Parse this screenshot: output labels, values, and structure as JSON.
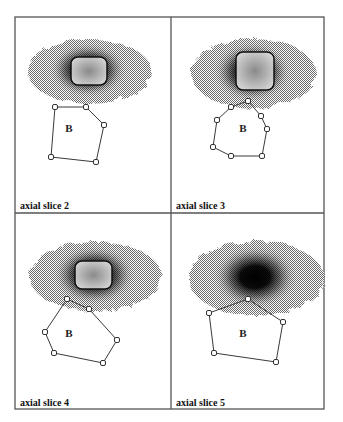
{
  "figure": {
    "grid": {
      "left": 15,
      "top": 17,
      "mid_x": 171,
      "mid_y": 213,
      "right": 324,
      "bottom": 409
    },
    "colors": {
      "frame": "#555555",
      "polygon": "#3a3a3a",
      "blob_dark": "#111111",
      "blob_halo": "#9a9a9a",
      "core": "#c8c8c8"
    },
    "panels": [
      {
        "id": "slice2",
        "label": "axial slice 2",
        "region_label": "B",
        "region_label_pos": [
          69,
          132
        ],
        "label_pos": [
          20,
          209
        ],
        "blob": {
          "cx": 88,
          "cy": 70,
          "rx": 62,
          "ry": 32,
          "core": {
            "x": 71,
            "y": 57,
            "w": 36,
            "h": 28
          },
          "has_core": true
        },
        "polygon": [
          [
            55,
            107
          ],
          [
            86,
            107
          ],
          [
            104,
            125
          ],
          [
            96,
            162
          ],
          [
            51,
            157
          ]
        ]
      },
      {
        "id": "slice3",
        "label": "axial slice 3",
        "region_label": "B",
        "region_label_pos": [
          243,
          132
        ],
        "label_pos": [
          176,
          209
        ],
        "blob": {
          "cx": 252,
          "cy": 72,
          "rx": 62,
          "ry": 35,
          "core": {
            "x": 236,
            "y": 52,
            "w": 38,
            "h": 38
          },
          "has_core": true
        },
        "polygon": [
          [
            248,
            101
          ],
          [
            231,
            107
          ],
          [
            217,
            120
          ],
          [
            213,
            147
          ],
          [
            231,
            156
          ],
          [
            262,
            156
          ],
          [
            267,
            129
          ],
          [
            261,
            116
          ]
        ]
      },
      {
        "id": "slice4",
        "label": "axial slice 4",
        "region_label": "B",
        "region_label_pos": [
          69,
          337
        ],
        "label_pos": [
          20,
          406
        ],
        "blob": {
          "cx": 94,
          "cy": 275,
          "rx": 66,
          "ry": 35,
          "core": {
            "x": 75,
            "y": 261,
            "w": 37,
            "h": 28
          },
          "has_core": true
        },
        "polygon": [
          [
            67,
            299
          ],
          [
            89,
            309
          ],
          [
            117,
            340
          ],
          [
            103,
            363
          ],
          [
            54,
            353
          ],
          [
            45,
            332
          ]
        ]
      },
      {
        "id": "slice5",
        "label": "axial slice 5",
        "region_label": "B",
        "region_label_pos": [
          243,
          337
        ],
        "label_pos": [
          176,
          406
        ],
        "blob": {
          "cx": 255,
          "cy": 277,
          "rx": 68,
          "ry": 37,
          "core": null,
          "has_core": false
        },
        "polygon": [
          [
            248,
            299
          ],
          [
            283,
            322
          ],
          [
            276,
            362
          ],
          [
            214,
            353
          ],
          [
            209,
            313
          ]
        ]
      }
    ]
  }
}
